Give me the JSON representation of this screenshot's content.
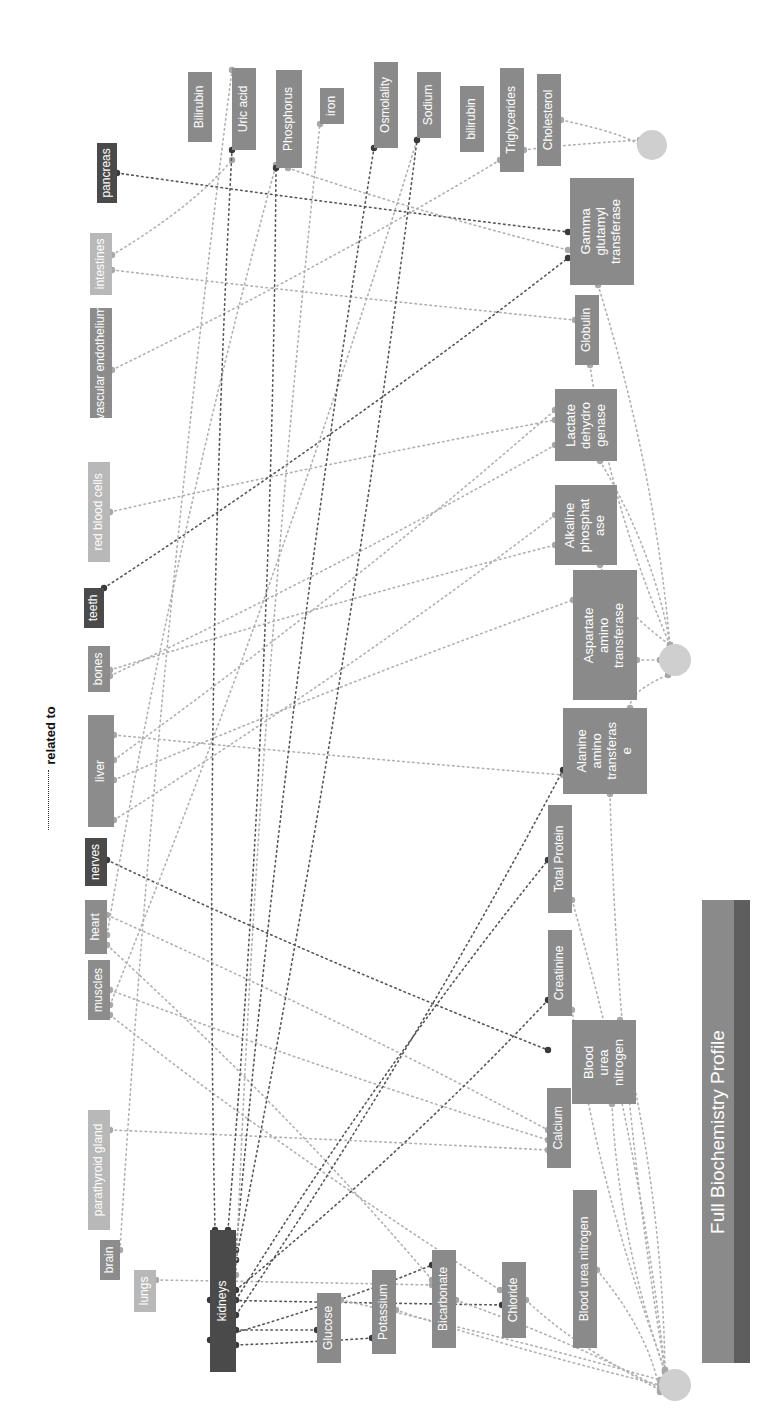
{
  "title": "Full Biochemistry Profile",
  "legend": {
    "label": "related to"
  },
  "colors": {
    "organ_dark": "#4a4a4a",
    "organ_mid": "#8c8c8c",
    "organ_light": "#b8b8b8",
    "test_box": "#8a8a8a",
    "hub": "#cfcfcf",
    "edge_dark": "#555555",
    "edge_light": "#b0b0b0"
  },
  "organs": [
    {
      "id": "pancreas",
      "label": "pancreas",
      "x": 97,
      "y": 143,
      "w": 20,
      "h": 60,
      "tone": "dark"
    },
    {
      "id": "intestines",
      "label": "intestines",
      "x": 90,
      "y": 233,
      "w": 22,
      "h": 62,
      "tone": "light"
    },
    {
      "id": "vascular-endothelium",
      "label": "vascular endothelium",
      "x": 90,
      "y": 308,
      "w": 22,
      "h": 110,
      "tone": "mid"
    },
    {
      "id": "red-blood-cells",
      "label": "red blood cells",
      "x": 88,
      "y": 462,
      "w": 22,
      "h": 100,
      "tone": "light"
    },
    {
      "id": "teeth",
      "label": "teeth",
      "x": 84,
      "y": 588,
      "w": 20,
      "h": 40,
      "tone": "dark"
    },
    {
      "id": "bones",
      "label": "bones",
      "x": 88,
      "y": 646,
      "w": 22,
      "h": 46,
      "tone": "mid"
    },
    {
      "id": "liver",
      "label": "liver",
      "x": 88,
      "y": 715,
      "w": 26,
      "h": 112,
      "tone": "mid"
    },
    {
      "id": "nerves",
      "label": "nerves",
      "x": 85,
      "y": 838,
      "w": 22,
      "h": 48,
      "tone": "dark"
    },
    {
      "id": "heart",
      "label": "heart",
      "x": 85,
      "y": 900,
      "w": 22,
      "h": 54,
      "tone": "mid"
    },
    {
      "id": "muscles",
      "label": "muscles",
      "x": 88,
      "y": 960,
      "w": 22,
      "h": 60,
      "tone": "mid"
    },
    {
      "id": "parathyroid-gland",
      "label": "parathyroid gland",
      "x": 88,
      "y": 1110,
      "w": 22,
      "h": 120,
      "tone": "light"
    },
    {
      "id": "brain",
      "label": "brain",
      "x": 100,
      "y": 1240,
      "w": 20,
      "h": 40,
      "tone": "mid"
    },
    {
      "id": "lungs",
      "label": "lungs",
      "x": 134,
      "y": 1270,
      "w": 22,
      "h": 42,
      "tone": "light"
    },
    {
      "id": "kidneys",
      "label": "kidneys",
      "x": 210,
      "y": 1230,
      "w": 26,
      "h": 142,
      "tone": "dark"
    }
  ],
  "tests": [
    {
      "id": "bilirubin-upper",
      "label": "Bilirubin",
      "x": 188,
      "y": 72,
      "w": 24,
      "h": 70
    },
    {
      "id": "uric-acid",
      "label": "Uric acid",
      "x": 232,
      "y": 68,
      "w": 24,
      "h": 82
    },
    {
      "id": "phosphorus",
      "label": "Phosphorus",
      "x": 276,
      "y": 70,
      "w": 26,
      "h": 98
    },
    {
      "id": "iron",
      "label": "iron",
      "x": 320,
      "y": 88,
      "w": 24,
      "h": 36
    },
    {
      "id": "osmolality",
      "label": "Osmolality",
      "x": 374,
      "y": 62,
      "w": 24,
      "h": 86
    },
    {
      "id": "sodium",
      "label": "Sodium",
      "x": 417,
      "y": 72,
      "w": 24,
      "h": 66
    },
    {
      "id": "bilirubin-lower",
      "label": "bilirubin",
      "x": 460,
      "y": 86,
      "w": 24,
      "h": 66
    },
    {
      "id": "triglycerides",
      "label": "Triglycerides",
      "x": 500,
      "y": 68,
      "w": 24,
      "h": 104
    },
    {
      "id": "cholesterol",
      "label": "Cholesterol",
      "x": 537,
      "y": 74,
      "w": 24,
      "h": 92
    },
    {
      "id": "gamma-glutamyl-transferase",
      "label": "Gamma\nglutamyl\ntransferase",
      "x": 570,
      "y": 178,
      "w": 64,
      "h": 107,
      "big": true
    },
    {
      "id": "globulin",
      "label": "Globulin",
      "x": 575,
      "y": 295,
      "w": 24,
      "h": 70
    },
    {
      "id": "lactate-dehydrogenase",
      "label": "Lactate\ndehydro\ngenase",
      "x": 555,
      "y": 389,
      "w": 62,
      "h": 72,
      "big": true
    },
    {
      "id": "alkaline-phosphatase",
      "label": "Alkaline\nphosphat\nase",
      "x": 555,
      "y": 485,
      "w": 62,
      "h": 80,
      "big": true
    },
    {
      "id": "aspartate-aminotransferase",
      "label": "Aspartate\namino\ntransferase",
      "x": 573,
      "y": 570,
      "w": 64,
      "h": 130,
      "big": true
    },
    {
      "id": "alanine-aminotransferase",
      "label": "Alanine\namino\ntransferas\ne",
      "x": 563,
      "y": 708,
      "w": 84,
      "h": 86,
      "big": true
    },
    {
      "id": "total-protein",
      "label": "Total Protein",
      "x": 548,
      "y": 805,
      "w": 24,
      "h": 108
    },
    {
      "id": "creatinine",
      "label": "Creatinine",
      "x": 548,
      "y": 930,
      "w": 24,
      "h": 86
    },
    {
      "id": "blood-urea-nitrogen-box",
      "label": "Blood\nurea\nnitrogen",
      "x": 572,
      "y": 1020,
      "w": 64,
      "h": 84,
      "big": true
    },
    {
      "id": "calcium",
      "label": "Calcium",
      "x": 547,
      "y": 1088,
      "w": 24,
      "h": 80
    },
    {
      "id": "blood-urea-nitrogen",
      "label": "Blood urea nitrogen",
      "x": 573,
      "y": 1190,
      "w": 24,
      "h": 158
    },
    {
      "id": "chloride",
      "label": "Chloride",
      "x": 502,
      "y": 1262,
      "w": 24,
      "h": 76
    },
    {
      "id": "bicarbonate",
      "label": "Bicarbonate",
      "x": 432,
      "y": 1250,
      "w": 24,
      "h": 98
    },
    {
      "id": "potassium",
      "label": "Potassium",
      "x": 372,
      "y": 1270,
      "w": 24,
      "h": 84
    },
    {
      "id": "glucose",
      "label": "Glucose",
      "x": 317,
      "y": 1293,
      "w": 24,
      "h": 70
    }
  ],
  "hubs": [
    {
      "id": "hub-lipids",
      "cx": 652,
      "cy": 145,
      "r": 15
    },
    {
      "id": "hub-liver-enzymes",
      "cx": 675,
      "cy": 660,
      "r": 16
    },
    {
      "id": "hub-electrolytes",
      "cx": 675,
      "cy": 1385,
      "r": 16
    }
  ],
  "edges": [
    {
      "from": [
        117,
        173
      ],
      "to": [
        568,
        232
      ],
      "dark": true
    },
    {
      "from": [
        112,
        255
      ],
      "to": [
        232,
        160
      ],
      "dark": false
    },
    {
      "from": [
        112,
        270
      ],
      "to": [
        575,
        320
      ],
      "dark": false
    },
    {
      "from": [
        112,
        370
      ],
      "to": [
        500,
        160
      ],
      "dark": false
    },
    {
      "from": [
        110,
        512
      ],
      "to": [
        555,
        420
      ],
      "dark": false
    },
    {
      "from": [
        104,
        588
      ],
      "to": [
        568,
        258
      ],
      "dark": true
    },
    {
      "from": [
        110,
        670
      ],
      "to": [
        555,
        545
      ],
      "dark": false
    },
    {
      "from": [
        110,
        676
      ],
      "to": [
        555,
        445
      ],
      "dark": false
    },
    {
      "from": [
        114,
        735
      ],
      "to": [
        563,
        775
      ],
      "dark": false
    },
    {
      "from": [
        114,
        760
      ],
      "to": [
        555,
        410
      ],
      "dark": false
    },
    {
      "from": [
        114,
        780
      ],
      "to": [
        573,
        600
      ],
      "dark": false
    },
    {
      "from": [
        114,
        820
      ],
      "to": [
        555,
        515
      ],
      "dark": false
    },
    {
      "from": [
        107,
        860
      ],
      "to": [
        548,
        1050
      ],
      "dark": true
    },
    {
      "from": [
        107,
        915
      ],
      "to": [
        548,
        1130
      ],
      "dark": false
    },
    {
      "from": [
        107,
        935
      ],
      "to": [
        276,
        165
      ],
      "dark": false
    },
    {
      "from": [
        107,
        945
      ],
      "to": [
        432,
        1280
      ],
      "dark": false
    },
    {
      "from": [
        110,
        990
      ],
      "to": [
        548,
        1140
      ],
      "dark": false
    },
    {
      "from": [
        110,
        1005
      ],
      "to": [
        417,
        140
      ],
      "dark": false
    },
    {
      "from": [
        110,
        1015
      ],
      "to": [
        500,
        1290
      ],
      "dark": false
    },
    {
      "from": [
        110,
        1130
      ],
      "to": [
        548,
        1150
      ],
      "dark": false
    },
    {
      "from": [
        120,
        1250
      ],
      "to": [
        232,
        70
      ],
      "dark": false
    },
    {
      "from": [
        156,
        1280
      ],
      "to": [
        432,
        1285
      ],
      "dark": false
    },
    {
      "from": [
        215,
        1230
      ],
      "to": [
        232,
        150
      ],
      "dark": true
    },
    {
      "from": [
        228,
        1230
      ],
      "to": [
        276,
        168
      ],
      "dark": true
    },
    {
      "from": [
        236,
        1250
      ],
      "to": [
        374,
        148
      ],
      "dark": true
    },
    {
      "from": [
        236,
        1260
      ],
      "to": [
        417,
        140
      ],
      "dark": true
    },
    {
      "from": [
        236,
        1275
      ],
      "to": [
        320,
        124
      ],
      "dark": false
    },
    {
      "from": [
        236,
        1290
      ],
      "to": [
        548,
        1000
      ],
      "dark": true
    },
    {
      "from": [
        236,
        1300
      ],
      "to": [
        548,
        860
      ],
      "dark": true
    },
    {
      "from": [
        236,
        1315
      ],
      "to": [
        563,
        770
      ],
      "dark": true
    },
    {
      "from": [
        236,
        1330
      ],
      "to": [
        317,
        1330
      ],
      "dark": true
    },
    {
      "from": [
        236,
        1345
      ],
      "to": [
        372,
        1338
      ],
      "dark": true
    },
    {
      "from": [
        210,
        1300
      ],
      "to": [
        502,
        1305
      ],
      "dark": true
    },
    {
      "from": [
        210,
        1340
      ],
      "to": [
        432,
        1265
      ],
      "dark": true
    },
    {
      "from": [
        288,
        168
      ],
      "to": [
        568,
        250
      ],
      "dark": false
    },
    {
      "from": [
        341,
        1300
      ],
      "to": [
        660,
        1380
      ],
      "dark": false
    },
    {
      "from": [
        396,
        1310
      ],
      "to": [
        660,
        1385
      ],
      "dark": false
    },
    {
      "from": [
        456,
        1300
      ],
      "to": [
        660,
        1388
      ],
      "dark": false
    },
    {
      "from": [
        526,
        1300
      ],
      "to": [
        660,
        1390
      ],
      "dark": false
    },
    {
      "from": [
        597,
        1270
      ],
      "to": [
        660,
        1392
      ],
      "dark": false
    },
    {
      "from": [
        612,
        1104
      ],
      "to": [
        665,
        1372
      ],
      "dark": false
    },
    {
      "from": [
        620,
        1020
      ],
      "to": [
        665,
        1372
      ],
      "dark": false
    },
    {
      "from": [
        572,
        1010
      ],
      "to": [
        665,
        1370
      ],
      "dark": false
    },
    {
      "from": [
        572,
        900
      ],
      "to": [
        665,
        1370
      ],
      "dark": false
    },
    {
      "from": [
        610,
        794
      ],
      "to": [
        665,
        1370
      ],
      "dark": false
    },
    {
      "from": [
        598,
        285
      ],
      "to": [
        670,
        645
      ],
      "dark": false
    },
    {
      "from": [
        590,
        365
      ],
      "to": [
        670,
        645
      ],
      "dark": false
    },
    {
      "from": [
        600,
        461
      ],
      "to": [
        670,
        645
      ],
      "dark": false
    },
    {
      "from": [
        600,
        565
      ],
      "to": [
        670,
        645
      ],
      "dark": false
    },
    {
      "from": [
        637,
        660
      ],
      "to": [
        660,
        660
      ],
      "dark": false
    },
    {
      "from": [
        630,
        708
      ],
      "to": [
        668,
        675
      ],
      "dark": false
    },
    {
      "from": [
        561,
        120
      ],
      "to": [
        640,
        145
      ],
      "dark": false
    },
    {
      "from": [
        524,
        150
      ],
      "to": [
        640,
        140
      ],
      "dark": false
    }
  ]
}
